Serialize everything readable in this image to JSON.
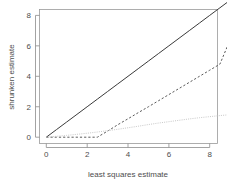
{
  "chart_data": {
    "type": "line",
    "title": "",
    "xlabel": "least squares estimate",
    "ylabel": "shrunken estimate",
    "xlim": [
      -0.35,
      9.5
    ],
    "ylim": [
      -0.45,
      9.3
    ],
    "grid": false,
    "legend": "none",
    "xticks": [
      "0",
      "2",
      "4",
      "6",
      "8"
    ],
    "xtick_values": [
      0,
      2,
      4,
      6,
      8
    ],
    "yticks": [
      "0",
      "2",
      "4",
      "6",
      "8"
    ],
    "ytick_values": [
      0,
      2,
      4,
      6,
      8
    ],
    "x": [
      0,
      0.5,
      1,
      1.5,
      2,
      2.5,
      3,
      3.5,
      4,
      4.5,
      5,
      5.5,
      6,
      6.5,
      7,
      7.5,
      8,
      8.5,
      9
    ],
    "series": [
      {
        "name": "identity",
        "style": "solid",
        "color": "#3a3a3a",
        "values": [
          0,
          0.5,
          1,
          1.5,
          2,
          2.5,
          3,
          3.5,
          4,
          4.5,
          5,
          5.5,
          6,
          6.5,
          7,
          7.5,
          8,
          8.5,
          9
        ]
      },
      {
        "name": "soft-threshold",
        "style": "dashed",
        "color": "#5a5a5a",
        "values": [
          0,
          0,
          0,
          0,
          0,
          0,
          0.4,
          0.82,
          1.21,
          1.61,
          2.0,
          2.4,
          2.8,
          3.2,
          3.6,
          4.0,
          4.4,
          4.8,
          6.4
        ]
      },
      {
        "name": "ridge",
        "style": "dotted",
        "color": "#c8c8c8",
        "values": [
          0,
          0.06,
          0.12,
          0.19,
          0.26,
          0.34,
          0.43,
          0.52,
          0.62,
          0.72,
          0.83,
          0.93,
          1.02,
          1.11,
          1.2,
          1.28,
          1.35,
          1.42,
          1.48
        ]
      }
    ]
  },
  "axes": {
    "x_title": "least squares estimate",
    "y_title": "shrunken estimate"
  }
}
